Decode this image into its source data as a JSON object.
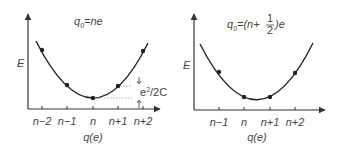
{
  "left_panel": {
    "title": {
      "q": "q",
      "sub": "0",
      "rest": "=ne"
    },
    "y_label": "E",
    "x_label": "q(e)",
    "ticks": [
      "n−2",
      "n−1",
      "n",
      "n+1",
      "n+2"
    ],
    "annotation": {
      "main": "e",
      "sup": "2",
      "rest": "/2C"
    }
  },
  "right_panel": {
    "title": {
      "q": "q",
      "sub": "0",
      "pre": "=(n+",
      "num": "1",
      "den": "2",
      "post": ")e"
    },
    "y_label": "E",
    "x_label": "q(e)",
    "ticks": [
      "n−1",
      "n",
      "n+1",
      "n+2"
    ]
  },
  "colors": {
    "curve": "#222222",
    "axis": "#333333",
    "guide": "#888888",
    "text": "#444444"
  }
}
